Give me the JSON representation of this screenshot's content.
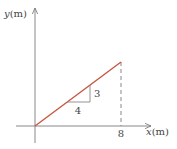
{
  "diagram": {
    "type": "position-time line graph",
    "y_axis": {
      "variable": "y",
      "unit": "(m)"
    },
    "x_axis": {
      "variable": "x",
      "unit": "(m)",
      "tick_labels": [
        "8"
      ]
    },
    "line": {
      "from": [
        0,
        0
      ],
      "to": [
        8,
        6
      ],
      "color": "#c8553d"
    },
    "slope_triangle": {
      "rise_label": "3",
      "run_label": "4"
    },
    "colors": {
      "axis": "#777777",
      "line": "#c8553d",
      "dashed": "#888888",
      "triangle": "#888888",
      "text": "#444444"
    }
  }
}
